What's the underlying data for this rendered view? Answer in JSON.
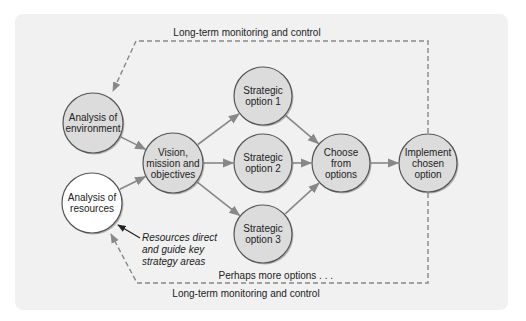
{
  "diagram": {
    "colors": {
      "panel_bg": "#f1f1f1",
      "node_fill": "#dcdcdc",
      "node_fill_highlight": "#ffffff",
      "node_stroke": "#555555",
      "arrow": "#888888",
      "dashed": "#888888",
      "annotation_arrow": "#222222"
    },
    "nodes": [
      {
        "id": "environment",
        "lines": [
          "Analysis of",
          "environment"
        ],
        "cx": 93,
        "cy": 123,
        "r": 30,
        "fill": "gray"
      },
      {
        "id": "resources",
        "lines": [
          "Analysis of",
          "resources"
        ],
        "cx": 92,
        "cy": 203,
        "r": 30,
        "fill": "white"
      },
      {
        "id": "vision",
        "lines": [
          "Vision,",
          "mission and",
          "objectives"
        ],
        "cx": 173,
        "cy": 163,
        "r": 30,
        "fill": "gray"
      },
      {
        "id": "option1",
        "lines": [
          "Strategic",
          "option 1"
        ],
        "cx": 263,
        "cy": 96,
        "r": 29,
        "fill": "gray"
      },
      {
        "id": "option2",
        "lines": [
          "Strategic",
          "option 2"
        ],
        "cx": 263,
        "cy": 163,
        "r": 29,
        "fill": "gray"
      },
      {
        "id": "option3",
        "lines": [
          "Strategic",
          "option 3"
        ],
        "cx": 263,
        "cy": 234,
        "r": 29,
        "fill": "gray"
      },
      {
        "id": "choose",
        "lines": [
          "Choose",
          "from",
          "options"
        ],
        "cx": 341,
        "cy": 163,
        "r": 29,
        "fill": "gray"
      },
      {
        "id": "implement",
        "lines": [
          "Implement",
          "chosen",
          "option"
        ],
        "cx": 428,
        "cy": 163,
        "r": 29,
        "fill": "gray"
      }
    ],
    "edges": [
      {
        "from": "environment",
        "to": "vision"
      },
      {
        "from": "resources",
        "to": "vision"
      },
      {
        "from": "vision",
        "to": "option1"
      },
      {
        "from": "vision",
        "to": "option2"
      },
      {
        "from": "vision",
        "to": "option3"
      },
      {
        "from": "option1",
        "to": "choose"
      },
      {
        "from": "option2",
        "to": "choose"
      },
      {
        "from": "option3",
        "to": "choose"
      },
      {
        "from": "choose",
        "to": "implement"
      }
    ],
    "labels": {
      "top_feedback": "Long-term monitoring and control",
      "bottom_feedback": "Long-term monitoring and control",
      "more_options": "Perhaps more options . . .",
      "annotation_lines": [
        "Resources direct",
        "and guide key",
        "strategy areas"
      ]
    }
  }
}
